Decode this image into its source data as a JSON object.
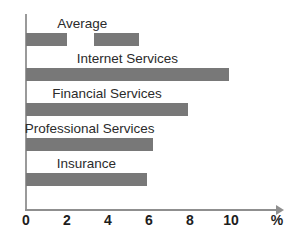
{
  "chart_data": {
    "type": "bar",
    "orientation": "horizontal",
    "title": "",
    "xlabel": "%",
    "ylabel": "",
    "xlim": [
      0,
      11.5
    ],
    "grid": false,
    "legend": false,
    "axis_unit": "%",
    "xticks": [
      0,
      2,
      4,
      6,
      8,
      10
    ],
    "xtick_labels": [
      "0",
      "2",
      "4",
      "6",
      "8",
      "10"
    ],
    "categories": [
      "Average",
      "Internet Services",
      "Financial Services",
      "Professional Services",
      "Insurance"
    ],
    "values": [
      2.0,
      9.9,
      7.9,
      6.2,
      5.9
    ],
    "bar_color": "#787878",
    "axis_color": "#8f8f8f",
    "text_color": "#2b2b2b",
    "bars": [
      {
        "label": "Average",
        "value": 2.0,
        "segments": [
          {
            "start": 0.0,
            "end": 2.0
          },
          {
            "start": 3.3,
            "end": 5.5
          }
        ]
      },
      {
        "label": "Internet Services",
        "value": 9.9,
        "segments": [
          {
            "start": 0.0,
            "end": 9.9
          }
        ]
      },
      {
        "label": "Financial Services",
        "value": 7.9,
        "segments": [
          {
            "start": 0.0,
            "end": 7.9
          }
        ]
      },
      {
        "label": "Professional Services",
        "value": 6.2,
        "segments": [
          {
            "start": 0.0,
            "end": 6.2
          }
        ]
      },
      {
        "label": "Insurance",
        "value": 5.9,
        "segments": [
          {
            "start": 0.0,
            "end": 5.9
          }
        ]
      }
    ]
  }
}
